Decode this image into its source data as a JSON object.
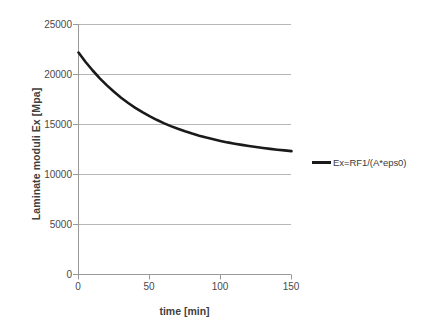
{
  "chart_data": {
    "type": "line",
    "title": "",
    "xlabel": "time [min]",
    "ylabel": "Laminate moduli Ex [Mpa]",
    "xlim": [
      0,
      150
    ],
    "ylim": [
      0,
      25000
    ],
    "xticks": [
      0,
      50,
      100,
      150
    ],
    "yticks": [
      0,
      5000,
      10000,
      15000,
      20000,
      25000
    ],
    "xtick_labels": [
      "0",
      "50",
      "100",
      "150"
    ],
    "ytick_labels": [
      "0",
      "5000",
      "10000",
      "15000",
      "20000",
      "25000"
    ],
    "grid": "horizontal",
    "legend_position": "right",
    "series": [
      {
        "name": "Ex=RF1/(A*eps0)",
        "color": "#1a1a1a",
        "x": [
          0,
          5,
          10,
          15,
          20,
          25,
          30,
          35,
          40,
          45,
          50,
          55,
          60,
          65,
          70,
          75,
          80,
          85,
          90,
          95,
          100,
          105,
          110,
          115,
          120,
          125,
          130,
          135,
          140,
          145,
          150
        ],
        "values": [
          22200,
          21250,
          20400,
          19620,
          18910,
          18270,
          17680,
          17150,
          16670,
          16230,
          15830,
          15470,
          15140,
          14840,
          14570,
          14320,
          14090,
          13880,
          13690,
          13520,
          13360,
          13210,
          13080,
          12960,
          12850,
          12750,
          12650,
          12560,
          12480,
          12410,
          12340
        ]
      }
    ]
  },
  "axes": {
    "y_title": "Laminate moduli Ex [Mpa]",
    "x_title": "time [min]",
    "y_labels": [
      "25000",
      "20000",
      "15000",
      "10000",
      "5000",
      "0"
    ],
    "x_labels": [
      "0",
      "50",
      "100",
      "150"
    ]
  },
  "legend": {
    "entries": [
      {
        "label": "Ex=RF1/(A*eps0)",
        "color": "#1a1a1a"
      }
    ]
  },
  "colors": {
    "series": "#1a1a1a",
    "gridline": "#b7b7b7",
    "axis": "#9a9a9a",
    "text": "#404040",
    "background": "#ffffff"
  }
}
